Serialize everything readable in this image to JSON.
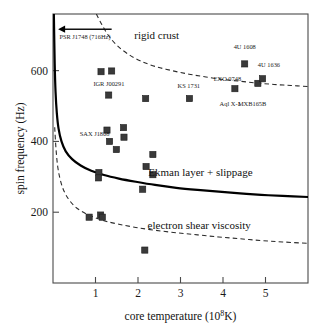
{
  "chart_data": {
    "type": "scatter",
    "title": "",
    "xlabel": "core temperature (10^8 K)",
    "xlabel_main": "core temperature (10",
    "xlabel_sup": "8",
    "xlabel_tail": "K)",
    "ylabel": "spin frequency (Hz)",
    "xlim": [
      0,
      6
    ],
    "ylim": [
      0,
      760
    ],
    "xticks": [
      1,
      2,
      3,
      4,
      5
    ],
    "xticklabels": [
      "1",
      "2",
      "3",
      "4",
      "5"
    ],
    "yticks": [
      200,
      400,
      600
    ],
    "yticklabels": [
      "200",
      "400",
      "600"
    ],
    "grid": false,
    "legend": "none",
    "marker_shape": "square",
    "marker_color": "#3a3a3a",
    "points": [
      {
        "x": 1.13,
        "y": 597,
        "label": "",
        "label_dx": 0,
        "label_dy": 0
      },
      {
        "x": 1.38,
        "y": 599,
        "label": "",
        "label_dx": 0,
        "label_dy": 0
      },
      {
        "x": 1.31,
        "y": 531,
        "label": "",
        "label_dx": 0,
        "label_dy": 0
      },
      {
        "x": 2.18,
        "y": 521,
        "label": "",
        "label_dx": 0,
        "label_dy": 0
      },
      {
        "x": 3.21,
        "y": 521,
        "label": "KS 1731",
        "label_dx": -2,
        "label_dy": -9
      },
      {
        "x": 4.28,
        "y": 549,
        "label": "",
        "label_dx": 0,
        "label_dy": 0
      },
      {
        "x": 4.51,
        "y": 619,
        "label": "4U 1608",
        "label_dx": 0,
        "label_dy": -10
      },
      {
        "x": 4.82,
        "y": 564,
        "label": "",
        "label_dx": 0,
        "label_dy": 0
      },
      {
        "x": 4.93,
        "y": 577,
        "label": "4U 1636",
        "label_dx": 4,
        "label_dy": -10
      },
      {
        "x": 1.27,
        "y": 432,
        "label": "",
        "label_dx": 0,
        "label_dy": 0
      },
      {
        "x": 1.66,
        "y": 439,
        "label": "",
        "label_dx": 0,
        "label_dy": 0
      },
      {
        "x": 1.33,
        "y": 400,
        "label": "",
        "label_dx": 0,
        "label_dy": 0
      },
      {
        "x": 1.67,
        "y": 412,
        "label": "",
        "label_dx": 0,
        "label_dy": 0
      },
      {
        "x": 1.49,
        "y": 377,
        "label": "",
        "label_dx": 0,
        "label_dy": 0
      },
      {
        "x": 2.35,
        "y": 363,
        "label": "",
        "label_dx": 0,
        "label_dy": 0
      },
      {
        "x": 2.19,
        "y": 329,
        "label": "",
        "label_dx": 0,
        "label_dy": 0
      },
      {
        "x": 2.35,
        "y": 306,
        "label": "",
        "label_dx": 0,
        "label_dy": 0
      },
      {
        "x": 1.08,
        "y": 312,
        "label": "",
        "label_dx": 0,
        "label_dy": 0
      },
      {
        "x": 1.07,
        "y": 297,
        "label": "",
        "label_dx": 0,
        "label_dy": 0
      },
      {
        "x": 2.11,
        "y": 265,
        "label": "",
        "label_dx": 0,
        "label_dy": 0
      },
      {
        "x": 0.85,
        "y": 186,
        "label": "",
        "label_dx": 0,
        "label_dy": 0
      },
      {
        "x": 1.12,
        "y": 192,
        "label": "",
        "label_dx": 0,
        "label_dy": 0
      },
      {
        "x": 1.16,
        "y": 186,
        "label": "",
        "label_dx": 0,
        "label_dy": 0
      },
      {
        "x": 2.16,
        "y": 93,
        "label": "",
        "label_dx": 0,
        "label_dy": 0
      }
    ],
    "point_labels": [
      {
        "text": "IGR J00291",
        "x": 0.95,
        "y": 558,
        "anchor": "start"
      },
      {
        "text": "SAX J1808",
        "x": 0.63,
        "y": 416,
        "anchor": "start"
      },
      {
        "text": "EXO 0748",
        "x": 3.78,
        "y": 572,
        "anchor": "start"
      },
      {
        "text": "Aql X-1",
        "x": 3.92,
        "y": 500,
        "anchor": "start"
      },
      {
        "text": "MXB165B",
        "x": 4.35,
        "y": 500,
        "anchor": "start"
      },
      {
        "text": "KS 1731",
        "x": 2.93,
        "y": 551,
        "anchor": "start"
      },
      {
        "text": "4U 1608",
        "x": 4.25,
        "y": 660,
        "anchor": "start"
      },
      {
        "text": "4U 1636",
        "x": 4.82,
        "y": 610,
        "anchor": "start"
      }
    ],
    "curves": [
      {
        "name": "rigid crust",
        "style": "dashed",
        "label": "rigid crust",
        "label_x": 2.44,
        "label_y": 690,
        "points": [
          [
            1.02,
            760
          ],
          [
            1.15,
            730
          ],
          [
            1.3,
            700
          ],
          [
            1.5,
            672
          ],
          [
            1.75,
            648
          ],
          [
            2.05,
            628
          ],
          [
            2.4,
            612
          ],
          [
            2.8,
            600
          ],
          [
            3.2,
            590
          ],
          [
            3.6,
            582
          ],
          [
            4.0,
            575
          ],
          [
            4.4,
            570
          ],
          [
            4.8,
            565
          ],
          [
            5.2,
            561
          ],
          [
            5.6,
            558
          ],
          [
            6.0,
            555
          ]
        ]
      },
      {
        "name": "Ekman layer + slippage",
        "style": "solid",
        "label": "Ekman layer + slippage",
        "label_x": 3.47,
        "label_y": 303,
        "points": [
          [
            0.02,
            760
          ],
          [
            0.04,
            620
          ],
          [
            0.06,
            540
          ],
          [
            0.09,
            480
          ],
          [
            0.13,
            437
          ],
          [
            0.2,
            400
          ],
          [
            0.3,
            372
          ],
          [
            0.45,
            350
          ],
          [
            0.65,
            332
          ],
          [
            0.9,
            317
          ],
          [
            1.2,
            305
          ],
          [
            1.55,
            295
          ],
          [
            1.95,
            286
          ],
          [
            2.4,
            277
          ],
          [
            2.9,
            269
          ],
          [
            3.4,
            263
          ],
          [
            3.9,
            258
          ],
          [
            4.4,
            253
          ],
          [
            4.9,
            249
          ],
          [
            5.4,
            246
          ],
          [
            6.0,
            243
          ]
        ]
      },
      {
        "name": "electron shear viscosity",
        "style": "dashed",
        "label": "electron shear viscosity",
        "label_x": 3.44,
        "label_y": 152,
        "points": [
          [
            0.04,
            440
          ],
          [
            0.07,
            380
          ],
          [
            0.11,
            330
          ],
          [
            0.17,
            292
          ],
          [
            0.25,
            262
          ],
          [
            0.36,
            238
          ],
          [
            0.5,
            218
          ],
          [
            0.68,
            202
          ],
          [
            0.9,
            189
          ],
          [
            1.2,
            176
          ],
          [
            1.55,
            166
          ],
          [
            1.95,
            157
          ],
          [
            2.4,
            149
          ],
          [
            2.9,
            142
          ],
          [
            3.4,
            136
          ],
          [
            3.9,
            130
          ],
          [
            4.4,
            125
          ],
          [
            4.9,
            120
          ],
          [
            5.4,
            116
          ],
          [
            6.0,
            112
          ]
        ]
      }
    ],
    "annotations": [
      {
        "type": "arrow-with-label",
        "text": "PSR J1748 (716Hz)",
        "arrow_from_x": 1.38,
        "arrow_to_x": 0.12,
        "arrow_y": 717,
        "text_x": 0.15,
        "text_y": 688
      }
    ]
  }
}
